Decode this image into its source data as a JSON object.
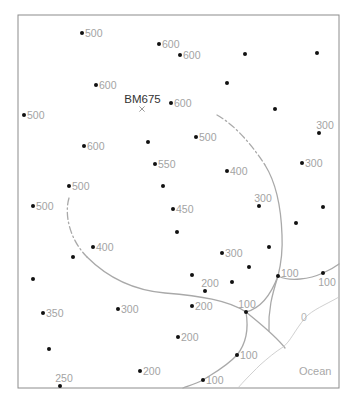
{
  "map": {
    "frame": {
      "x": 18,
      "y": 15,
      "width": 321,
      "height": 373
    },
    "benchmark": {
      "label": "BM675",
      "x": 142,
      "y": 109,
      "label_x": 142.5,
      "label_y": 103
    },
    "ocean_label": {
      "text": "Ocean",
      "x": 299,
      "y": 375
    },
    "zero_contour_label": {
      "text": "0",
      "x": 301,
      "y": 321
    },
    "contours": [
      {
        "name": "upper-arc-dashed",
        "style": "dashed",
        "d": "M217,115 C235,125 252,145 265,165"
      },
      {
        "name": "upper-arc",
        "style": "solid",
        "d": "M265,165 C275,181 281,205 282,235 C283,255 280,268 278,276"
      },
      {
        "name": "left-arc-dashed",
        "style": "dashed",
        "d": "M69,198 C64,215 70,240 87,257"
      },
      {
        "name": "left-arc",
        "style": "solid",
        "d": "M87,257 C105,275 130,290 165,293 C200,296 228,300 246,312"
      },
      {
        "name": "junction-link",
        "style": "solid",
        "d": "M246,312 C262,308 272,292 278,276"
      },
      {
        "name": "east-branch",
        "style": "solid",
        "d": "M278,276 C290,282 310,279 323,273 C330,270 335,267 339,264"
      },
      {
        "name": "south-branch",
        "style": "solid",
        "d": "M278,276 C272,295 268,310 269,331"
      },
      {
        "name": "southeast-branch",
        "style": "solid",
        "d": "M246,312 C258,322 275,335 285,348"
      },
      {
        "name": "southwest-branch",
        "style": "solid",
        "d": "M246,312 C249,330 245,345 237,355 C225,368 210,375 203,380 C195,384 188,386 183,388"
      },
      {
        "name": "zero-contour",
        "style": "thin",
        "d": "M339,297 C325,305 312,310 305,318 C295,330 290,342 283,347 C275,352 268,358 260,365 C250,375 243,382 238,388"
      }
    ],
    "points": [
      {
        "x": 82,
        "y": 33,
        "label": "500",
        "pos": "right"
      },
      {
        "x": 159,
        "y": 44,
        "label": "600",
        "pos": "right"
      },
      {
        "x": 180,
        "y": 55,
        "label": "600",
        "pos": "right"
      },
      {
        "x": 245,
        "y": 54,
        "label": "",
        "pos": "right"
      },
      {
        "x": 317,
        "y": 53,
        "label": "",
        "pos": "right"
      },
      {
        "x": 96,
        "y": 85,
        "label": "600",
        "pos": "right"
      },
      {
        "x": 227,
        "y": 83,
        "label": "",
        "pos": "right"
      },
      {
        "x": 24,
        "y": 115,
        "label": "500",
        "pos": "right"
      },
      {
        "x": 171,
        "y": 103,
        "label": "600",
        "pos": "right"
      },
      {
        "x": 275,
        "y": 109,
        "label": "",
        "pos": "right"
      },
      {
        "x": 319,
        "y": 133,
        "label": "300",
        "pos": "above",
        "dx": 6
      },
      {
        "x": 196,
        "y": 137,
        "label": "500",
        "pos": "right"
      },
      {
        "x": 84,
        "y": 146,
        "label": "600",
        "pos": "right"
      },
      {
        "x": 148,
        "y": 142,
        "label": "",
        "pos": "right"
      },
      {
        "x": 155,
        "y": 164,
        "label": "550",
        "pos": "right"
      },
      {
        "x": 227,
        "y": 171,
        "label": "400",
        "pos": "right"
      },
      {
        "x": 302,
        "y": 163,
        "label": "300",
        "pos": "right"
      },
      {
        "x": 69,
        "y": 186,
        "label": "500",
        "pos": "right"
      },
      {
        "x": 163,
        "y": 186,
        "label": "",
        "pos": "right"
      },
      {
        "x": 259,
        "y": 206,
        "label": "300",
        "pos": "above",
        "dx": 4
      },
      {
        "x": 33,
        "y": 206,
        "label": "500",
        "pos": "right"
      },
      {
        "x": 173,
        "y": 209,
        "label": "450",
        "pos": "right"
      },
      {
        "x": 323,
        "y": 207,
        "label": "",
        "pos": "right"
      },
      {
        "x": 177,
        "y": 232,
        "label": "",
        "pos": "right"
      },
      {
        "x": 296,
        "y": 223,
        "label": "",
        "pos": "right"
      },
      {
        "x": 93,
        "y": 247,
        "label": "400",
        "pos": "right"
      },
      {
        "x": 73,
        "y": 257,
        "label": "",
        "pos": "right"
      },
      {
        "x": 269,
        "y": 247,
        "label": "",
        "pos": "right"
      },
      {
        "x": 222,
        "y": 253,
        "label": "300",
        "pos": "right"
      },
      {
        "x": 33,
        "y": 279,
        "label": "",
        "pos": "right"
      },
      {
        "x": 192,
        "y": 275,
        "label": "",
        "pos": "right"
      },
      {
        "x": 249,
        "y": 267,
        "label": "",
        "pos": "right"
      },
      {
        "x": 205,
        "y": 291,
        "label": "200",
        "pos": "above",
        "dx": 5
      },
      {
        "x": 232,
        "y": 282,
        "label": "",
        "pos": "right"
      },
      {
        "x": 278,
        "y": 276,
        "label": "100",
        "pos": "right",
        "dy": -3
      },
      {
        "x": 323,
        "y": 273,
        "label": "100",
        "pos": "below",
        "dx": 4
      },
      {
        "x": 43,
        "y": 313,
        "label": "350",
        "pos": "right"
      },
      {
        "x": 118,
        "y": 309,
        "label": "300",
        "pos": "right"
      },
      {
        "x": 192,
        "y": 306,
        "label": "200",
        "pos": "right"
      },
      {
        "x": 246,
        "y": 312,
        "label": "100",
        "pos": "above",
        "dx": 1
      },
      {
        "x": 178,
        "y": 337,
        "label": "200",
        "pos": "right"
      },
      {
        "x": 49,
        "y": 349,
        "label": "",
        "pos": "right"
      },
      {
        "x": 237,
        "y": 355,
        "label": "100",
        "pos": "right"
      },
      {
        "x": 140,
        "y": 371,
        "label": "200",
        "pos": "right"
      },
      {
        "x": 60,
        "y": 386,
        "label": "250",
        "pos": "above",
        "dx": 4
      },
      {
        "x": 203,
        "y": 380,
        "label": "100",
        "pos": "right"
      }
    ]
  },
  "colors": {
    "dot": "#111111",
    "label": "#a3a3a3",
    "contour": "#a9a9a9",
    "frame": "#8c8c8c",
    "benchmark_text": "#333333"
  }
}
